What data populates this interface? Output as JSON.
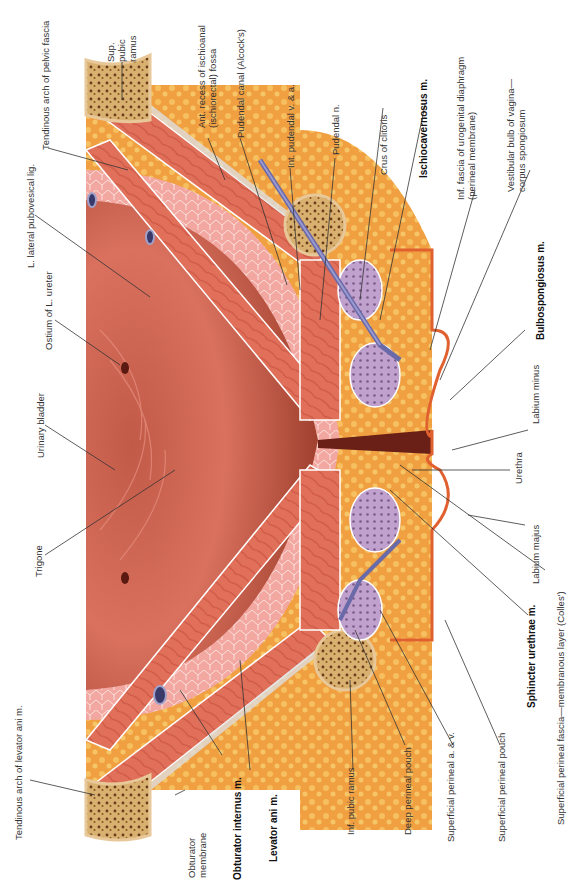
{
  "figure": {
    "type": "anatomical-illustration",
    "orientation": "rotated 90deg counter-clockwise (labels read bottom-to-top)"
  },
  "labels": {
    "tendinous_arch_pelvic_fascia": "Tendinous arch of pelvic fascia",
    "sup_pubic_ramus_1": "Sup.",
    "sup_pubic_ramus_2": "pubic",
    "sup_pubic_ramus_3": "ramus",
    "l_lateral_pubovesical_lig": "L. lateral pubovesical lig.",
    "ant_recess_1": "Ant. recess of ischioanal",
    "ant_recess_2": "(ischiorectal) fossa",
    "pudendal_canal": "Pudendal canal (Alcock's)",
    "int_pudendal": "Int. pudendal v. & a.",
    "pudendal_n": "Pudendal n.",
    "crus_clitoris": "Crus of clitoris",
    "ischiocavernosus": "Ischiocavernosus m.",
    "inf_fascia_1": "Inf. fascia of urogenital diaphragm",
    "inf_fascia_2": "(perineal membrane)",
    "vestibular_bulb_1": "Vestibular bulb of vagina—",
    "vestibular_bulb_2": "corpus spongiosum",
    "ostium_ureter": "Ostium of L. ureter",
    "urinary_bladder": "Urinary bladder",
    "trigone": "Trigone",
    "bulbospongiosus": "Bulbospongiosus m.",
    "labium_minus": "Labium minus",
    "urethra": "Urethra",
    "labium_majus": "Labium majus",
    "sphincter_urethrae": "Sphincter urethrae m.",
    "superficial_fascia": "Superficial perineal fascia—membranous layer (Colles')",
    "superficial_pouch": "Superficial perineal pouch",
    "superficial_av": "Superficial perineal a. & v.",
    "deep_pouch": "Deep perineal pouch",
    "inf_pubic_ramus": "Inf. pubic ramus",
    "levator_ani": "Levator ani m.",
    "obturator_internus": "Obturator internus m.",
    "obturator_membrane_1": "Obturator",
    "obturator_membrane_2": "membrane",
    "tendinous_arch_levator": "Tendinous arch of levator ani m."
  },
  "colors": {
    "fat": "#f0a040",
    "fat_light": "#f7c766",
    "muscle": "#e0705a",
    "muscle_dark": "#c8503e",
    "bladder": "#d9715e",
    "bladder_dark": "#a0402e",
    "bladder_wall": "#f2a8a0",
    "bone": "#d8b070",
    "bone_spots": "#6a3a1a",
    "erectile": "#b890c0",
    "vein": "#6a6aa8",
    "leader": "#333333"
  }
}
